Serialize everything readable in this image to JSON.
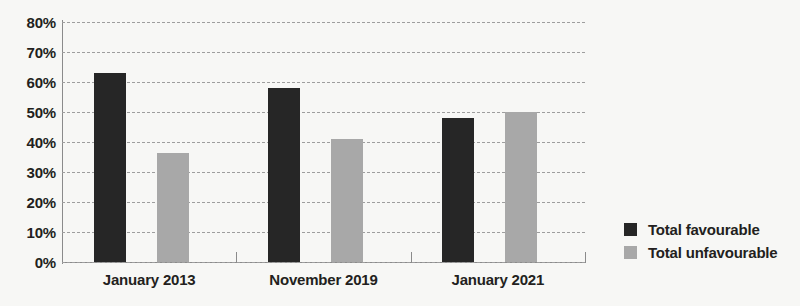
{
  "chart_data": {
    "type": "bar",
    "title": "",
    "subtitle": "",
    "xlabel": "",
    "ylabel": "",
    "categories": [
      "January 2013",
      "November 2019",
      "January 2021"
    ],
    "series": [
      {
        "name": "Total favourable",
        "color": "#262626",
        "values": [
          63,
          58,
          48
        ]
      },
      {
        "name": "Total unfavourable",
        "color": "#a8a8a8",
        "values": [
          36.5,
          41,
          50
        ]
      }
    ],
    "ylim": [
      0,
      80
    ],
    "ytick_step": 10,
    "ytick_labels": [
      "0%",
      "10%",
      "20%",
      "30%",
      "40%",
      "50%",
      "60%",
      "70%",
      "80%"
    ],
    "grid": true,
    "grid_style": "dashed",
    "legend_position": "right",
    "value_suffix": "%",
    "background_color": "#f7f7f5",
    "axis_color": "#8b8b8b"
  }
}
